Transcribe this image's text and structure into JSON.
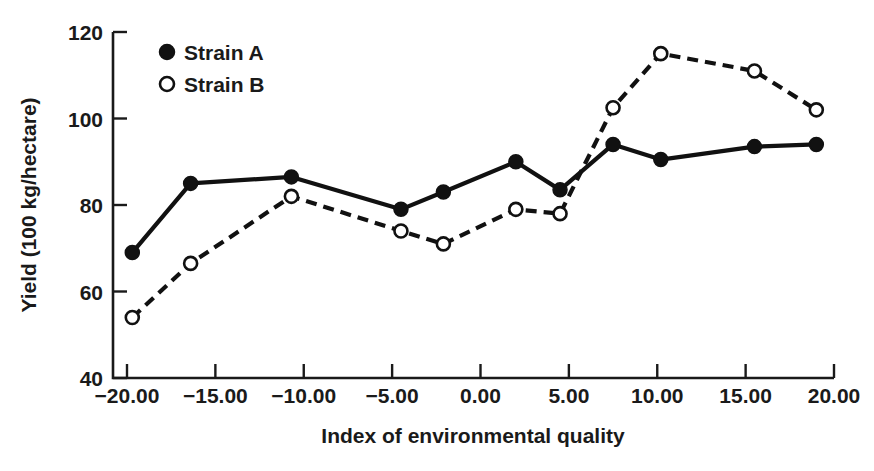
{
  "chart_data": {
    "type": "line",
    "title": "",
    "xlabel": "Index of environmental quality",
    "ylabel": "Yield (100 kg/hectare)",
    "xlim": [
      -20,
      20
    ],
    "ylim": [
      40,
      120
    ],
    "xticks": [
      -20,
      -15,
      -10,
      -5,
      0,
      5,
      10,
      15,
      20
    ],
    "xtick_labels": [
      "-20.00",
      "-15.00",
      "-10.00",
      "-5.00",
      "0.00",
      "5.00",
      "10.00",
      "15.00",
      "20.00"
    ],
    "yticks": [
      40,
      60,
      80,
      100,
      120
    ],
    "ytick_labels": [
      "40",
      "60",
      "80",
      "100",
      "120"
    ],
    "grid": false,
    "legend_position": "top-left",
    "x": [
      -19.7,
      -16.4,
      -10.7,
      -4.5,
      -2.1,
      2.0,
      4.5,
      7.5,
      10.2,
      15.5,
      19.0
    ],
    "series": [
      {
        "name": "Strain A",
        "marker": "filled-circle",
        "linestyle": "solid",
        "color": "#111111",
        "values": [
          69,
          85,
          86.5,
          79,
          83,
          90,
          83.5,
          94,
          90.5,
          93.5,
          94
        ]
      },
      {
        "name": "Strain B",
        "marker": "open-circle",
        "linestyle": "dashed",
        "color": "#111111",
        "values": [
          54,
          66.5,
          82,
          74,
          71,
          79,
          78,
          102.5,
          115,
          111,
          102
        ]
      }
    ]
  },
  "legend": {
    "items": [
      {
        "label": "Strain A",
        "marker": "filled-circle"
      },
      {
        "label": "Strain B",
        "marker": "open-circle"
      }
    ]
  }
}
